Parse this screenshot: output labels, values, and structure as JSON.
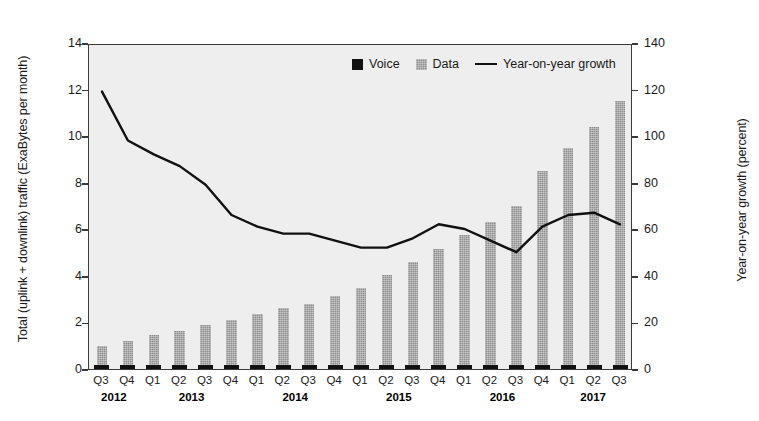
{
  "chart_data": {
    "type": "bar",
    "title": "",
    "categories": [
      "Q3",
      "Q4",
      "Q1",
      "Q2",
      "Q3",
      "Q4",
      "Q1",
      "Q2",
      "Q3",
      "Q4",
      "Q1",
      "Q2",
      "Q3",
      "Q4",
      "Q1",
      "Q2",
      "Q3",
      "Q4",
      "Q1",
      "Q2",
      "Q3"
    ],
    "year_groups": [
      {
        "year": "2012",
        "start_index": 0,
        "end_index": 1
      },
      {
        "year": "2013",
        "start_index": 2,
        "end_index": 5
      },
      {
        "year": "2014",
        "start_index": 6,
        "end_index": 9
      },
      {
        "year": "2015",
        "start_index": 10,
        "end_index": 13
      },
      {
        "year": "2016",
        "start_index": 14,
        "end_index": 17
      },
      {
        "year": "2017",
        "start_index": 18,
        "end_index": 20
      }
    ],
    "series": [
      {
        "name": "Voice",
        "axis": "left",
        "color": "#111111",
        "values": [
          0.15,
          0.15,
          0.15,
          0.15,
          0.15,
          0.15,
          0.15,
          0.15,
          0.15,
          0.15,
          0.15,
          0.15,
          0.15,
          0.15,
          0.15,
          0.15,
          0.15,
          0.15,
          0.15,
          0.15,
          0.15
        ]
      },
      {
        "name": "Data",
        "axis": "left",
        "color": "#8e8e8e",
        "values": [
          1.0,
          1.2,
          1.45,
          1.65,
          1.9,
          2.1,
          2.35,
          2.6,
          2.8,
          3.15,
          3.5,
          4.05,
          4.6,
          5.15,
          5.75,
          6.3,
          7.0,
          8.5,
          9.5,
          10.4,
          11.5
        ]
      },
      {
        "name": "Year-on-year growth",
        "axis": "right",
        "color": "#111111",
        "type": "line",
        "values": [
          120,
          99,
          93,
          88,
          80,
          67,
          62,
          59,
          59,
          56,
          53,
          53,
          57,
          63,
          61,
          56,
          51,
          62,
          67,
          68,
          63
        ]
      }
    ],
    "xlabel": "",
    "ylabel_left": "Total (uplink + downlink) traffic (ExaBytes per month)",
    "ylabel_right": "Year-on-year growth (percent)",
    "ylim_left": [
      0,
      14
    ],
    "ytick_left": [
      "0",
      "2",
      "4",
      "6",
      "8",
      "10",
      "12",
      "14"
    ],
    "ylim_right": [
      0,
      140
    ],
    "ytick_right": [
      "0",
      "20",
      "40",
      "60",
      "80",
      "100",
      "120",
      "140"
    ],
    "grid": false,
    "legend_position": "top-center",
    "legend": [
      {
        "label": "Voice",
        "marker": "square-black"
      },
      {
        "label": "Data",
        "marker": "square-gray"
      },
      {
        "label": "Year-on-year growth",
        "marker": "line"
      }
    ]
  }
}
